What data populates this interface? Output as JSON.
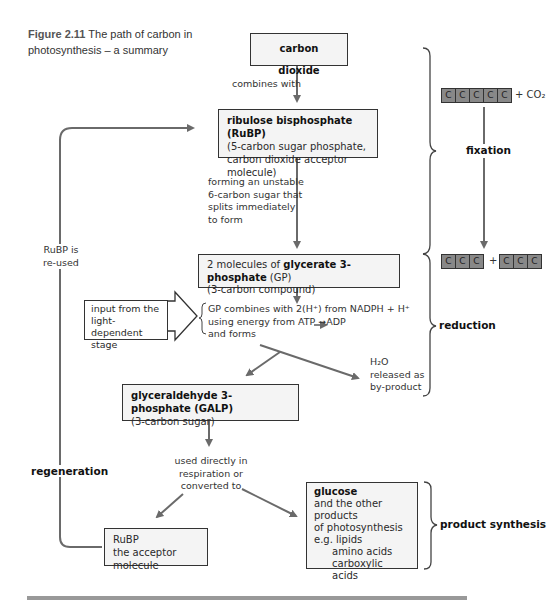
{
  "figure": {
    "number": "Figure 2.11",
    "caption": "The path of carbon in photosynthesis – a summary"
  },
  "nodes": {
    "carbon_dioxide": {
      "title": "carbon dioxide"
    },
    "rubp": {
      "title": "ribulose bisphosphate (RuBP)",
      "line1": "(5-carbon sugar phosphate,",
      "line2": "carbon dioxide acceptor molecule)"
    },
    "gp": {
      "prefix": "2 molecules of ",
      "title": "glycerate 3-phosphate",
      "suffix": " (GP)",
      "line1": "(3-carbon compound)"
    },
    "light_input": {
      "line1": "input from the",
      "line2": "light-dependent",
      "line3": "stage"
    },
    "galp": {
      "title": "glyceraldehyde 3-phosphate (GALP)",
      "line1": "(3-carbon sugar)"
    },
    "rubp_acceptor": {
      "line1": "RuBP",
      "line2": "the acceptor molecule"
    },
    "glucose": {
      "title": "glucose",
      "line1": "and the other products",
      "line2": "of photosynthesis",
      "line3": "e.g. lipids",
      "line4": "amino acids",
      "line5": "carboxylic acids"
    }
  },
  "edge_labels": {
    "combines_with": "combines with",
    "forming": [
      "forming an unstable",
      "6-carbon sugar that",
      "splits immediately",
      "to form"
    ],
    "reduction_step": [
      "GP combines with 2(H⁺) from NADPH + H⁺",
      "using energy from ATP ➞ADP",
      "and forms"
    ],
    "water": [
      "H₂O",
      "released as",
      "by-product"
    ],
    "used_directly": [
      "used directly in",
      "respiration or",
      "converted to"
    ],
    "rubp_reused": [
      "RuBP is",
      "re-used"
    ]
  },
  "stages": {
    "fixation": "fixation",
    "reduction": "reduction",
    "regeneration": "regeneration",
    "product_synthesis": "product synthesis"
  },
  "carbon_schematic": {
    "top_atoms": [
      "C",
      "C",
      "C",
      "C",
      "C"
    ],
    "top_plus": "+ CO₂",
    "bottom_left": [
      "C",
      "C",
      "C"
    ],
    "bottom_plus": "+",
    "bottom_right": [
      "C",
      "C",
      "C"
    ]
  },
  "colors": {
    "line": "#6a6a6a",
    "box_fill": "#f4f4f4",
    "atom_fill": "#888888"
  }
}
